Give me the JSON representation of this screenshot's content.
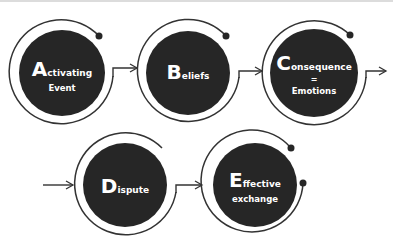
{
  "diagram": {
    "type": "process-flow",
    "colors": {
      "disc": "#262626",
      "ring": "#333333",
      "text": "#ffffff",
      "background": "#ffffff"
    },
    "steps": [
      {
        "id": "A",
        "initial": "A",
        "rest": "ctivating",
        "line2": "Event",
        "line3": ""
      },
      {
        "id": "B",
        "initial": "B",
        "rest": "eliefs",
        "line2": "",
        "line3": ""
      },
      {
        "id": "C",
        "initial": "C",
        "rest": "onsequence",
        "line2": "=",
        "line3": "Emotions"
      },
      {
        "id": "D",
        "initial": "D",
        "rest": "ispute",
        "line2": "",
        "line3": ""
      },
      {
        "id": "E",
        "initial": "E",
        "rest": "ffective",
        "line2": "exchange",
        "line3": ""
      }
    ],
    "edges": [
      {
        "from": "A",
        "to": "B"
      },
      {
        "from": "B",
        "to": "C"
      },
      {
        "from": "C",
        "to": "next-row"
      },
      {
        "from": "prev-row",
        "to": "D"
      },
      {
        "from": "D",
        "to": "E"
      }
    ]
  }
}
